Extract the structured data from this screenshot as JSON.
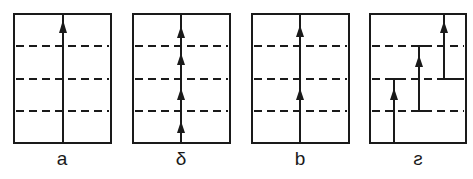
{
  "diagram": {
    "colors": {
      "stroke": "#1a1a1a",
      "background": "#ffffff"
    },
    "panels": [
      {
        "id": "a",
        "label": "a",
        "x": 14,
        "arrows": "single arrowhead near top of continuous vertical line"
      },
      {
        "id": "delta",
        "label": "δ",
        "x": 133,
        "arrows": "four arrowheads, one per layer, on continuous vertical line"
      },
      {
        "id": "b",
        "label": "b",
        "x": 252,
        "arrows": "two arrowheads on continuous vertical line"
      },
      {
        "id": "s",
        "label": "ƨ",
        "x": 370,
        "arrows": "three staggered vertical segments, each spanning layers, with arrowheads"
      }
    ],
    "box": {
      "top": 14,
      "bottom": 143,
      "width": 97
    },
    "dashed_lines_y": [
      46,
      79,
      111
    ]
  }
}
